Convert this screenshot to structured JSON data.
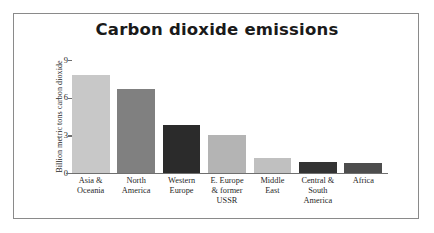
{
  "frame": {
    "border_color": "#8a8a8a",
    "background": "#ffffff"
  },
  "chart_data": {
    "type": "bar",
    "title": "Carbon dioxide emissions",
    "xlabel": "",
    "ylabel": "Billion metric tons carbon dioxide",
    "ylim": [
      0,
      9
    ],
    "yticks": [
      0,
      3,
      6,
      9
    ],
    "ytick_labels": [
      "0",
      "3",
      "6",
      "9"
    ],
    "grid": false,
    "legend": false,
    "categories": [
      "Asia & Oceania",
      "North America",
      "Western Europe",
      "E. Europe & former USSR",
      "Middle East",
      "Central & South America",
      "Africa"
    ],
    "category_lines": [
      [
        "Asia &",
        "Oceania"
      ],
      [
        "North",
        "America"
      ],
      [
        "Western",
        "Europe"
      ],
      [
        "E. Europe",
        "& former",
        "USSR"
      ],
      [
        "Middle",
        "East"
      ],
      [
        "Central &",
        "South",
        "America"
      ],
      [
        "Africa"
      ]
    ],
    "values": [
      7.8,
      6.7,
      3.8,
      3.0,
      1.2,
      0.9,
      0.8
    ],
    "bar_colors": [
      "#c8c8c8",
      "#808080",
      "#2b2b2b",
      "#b4b4b4",
      "#c0c0c0",
      "#333333",
      "#4d4d4d"
    ],
    "axis_color": "#6f6f6f",
    "text_color": "#1f1f1f"
  }
}
